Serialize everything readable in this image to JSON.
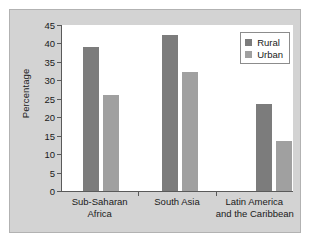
{
  "chart_data": {
    "type": "bar",
    "title": "",
    "subtitle": "",
    "xlabel": "",
    "ylabel": "Percentage",
    "ylim": [
      0,
      45
    ],
    "yticks": [
      0,
      5,
      10,
      15,
      20,
      25,
      30,
      35,
      40,
      45
    ],
    "ytick_labels": [
      "0",
      "5",
      "10",
      "15",
      "20",
      "25",
      "30",
      "35",
      "40",
      "45"
    ],
    "grid": false,
    "legend_position": "top-right",
    "categories": [
      "Sub-Saharan Africa",
      "South Asia",
      "Latin America and the Caribbean"
    ],
    "category_label_lines": [
      [
        "Sub-Saharan",
        "Africa"
      ],
      [
        "South Asia",
        ""
      ],
      [
        "Latin America",
        "and the Caribbean"
      ]
    ],
    "series": [
      {
        "name": "Rural",
        "color": "#7c7c7c",
        "values": [
          39.0,
          42.3,
          23.5
        ]
      },
      {
        "name": "Urban",
        "color": "#a0a0a0",
        "values": [
          26.0,
          32.3,
          13.5
        ]
      }
    ]
  },
  "legend": {
    "entries": [
      {
        "label": "Rural",
        "swatch": "rural"
      },
      {
        "label": "Urban",
        "swatch": "urban"
      }
    ]
  },
  "colors": {
    "panel_background": "#d3d3d3",
    "plot_background": "#ffffff",
    "axis": "#5a5a5a",
    "text": "#1a1a1a",
    "rural": "#7c7c7c",
    "urban": "#a0a0a0"
  }
}
